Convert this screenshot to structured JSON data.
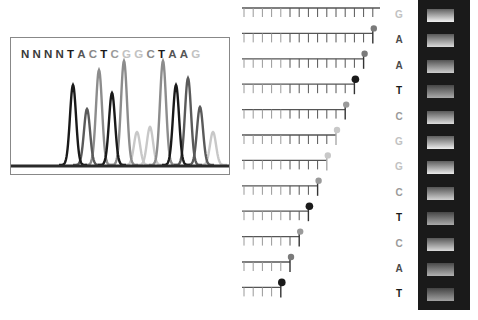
{
  "chromatogram": {
    "sequence": [
      {
        "base": "N",
        "color": "#3a3a3a"
      },
      {
        "base": "N",
        "color": "#3a3a3a"
      },
      {
        "base": "N",
        "color": "#3a3a3a"
      },
      {
        "base": "N",
        "color": "#3a3a3a"
      },
      {
        "base": "T",
        "color": "#1a1a1a"
      },
      {
        "base": "A",
        "color": "#555555"
      },
      {
        "base": "C",
        "color": "#888888"
      },
      {
        "base": "T",
        "color": "#1a1a1a"
      },
      {
        "base": "C",
        "color": "#9a9a9a"
      },
      {
        "base": "G",
        "color": "#c2c2c2"
      },
      {
        "base": "G",
        "color": "#c2c2c2"
      },
      {
        "base": "C",
        "color": "#8a8a8a"
      },
      {
        "base": "T",
        "color": "#1a1a1a"
      },
      {
        "base": "A",
        "color": "#555555"
      },
      {
        "base": "A",
        "color": "#555555"
      },
      {
        "base": "G",
        "color": "#c2c2c2"
      }
    ],
    "peaks": [
      {
        "x": 62,
        "h": 80,
        "color": "#1a1a1a"
      },
      {
        "x": 76,
        "h": 56,
        "color": "#5a5a5a"
      },
      {
        "x": 88,
        "h": 95,
        "color": "#8c8c8c"
      },
      {
        "x": 101,
        "h": 72,
        "color": "#1a1a1a"
      },
      {
        "x": 113,
        "h": 104,
        "color": "#8c8c8c"
      },
      {
        "x": 126,
        "h": 33,
        "color": "#c8c8c8"
      },
      {
        "x": 139,
        "h": 38,
        "color": "#c8c8c8"
      },
      {
        "x": 152,
        "h": 104,
        "color": "#8c8c8c"
      },
      {
        "x": 165,
        "h": 80,
        "color": "#1a1a1a"
      },
      {
        "x": 177,
        "h": 87,
        "color": "#5a5a5a"
      },
      {
        "x": 189,
        "h": 58,
        "color": "#5a5a5a"
      },
      {
        "x": 202,
        "h": 33,
        "color": "#c8c8c8"
      }
    ]
  },
  "fragments": [
    {
      "base": "G",
      "ticks": 15,
      "dot": "#c8c8c8",
      "label_color": "#c2c2c2"
    },
    {
      "base": "A",
      "ticks": 14,
      "dot": "#7a7a7a",
      "label_color": "#4a4a4a"
    },
    {
      "base": "A",
      "ticks": 13,
      "dot": "#7a7a7a",
      "label_color": "#4a4a4a"
    },
    {
      "base": "T",
      "ticks": 12,
      "dot": "#1a1a1a",
      "label_color": "#1a1a1a"
    },
    {
      "base": "C",
      "ticks": 11,
      "dot": "#9a9a9a",
      "label_color": "#9a9a9a"
    },
    {
      "base": "G",
      "ticks": 10,
      "dot": "#c8c8c8",
      "label_color": "#c2c2c2"
    },
    {
      "base": "G",
      "ticks": 9,
      "dot": "#c8c8c8",
      "label_color": "#c2c2c2"
    },
    {
      "base": "C",
      "ticks": 8,
      "dot": "#9a9a9a",
      "label_color": "#9a9a9a"
    },
    {
      "base": "T",
      "ticks": 7,
      "dot": "#1a1a1a",
      "label_color": "#1a1a1a"
    },
    {
      "base": "C",
      "ticks": 6,
      "dot": "#9a9a9a",
      "label_color": "#9a9a9a"
    },
    {
      "base": "A",
      "ticks": 5,
      "dot": "#7a7a7a",
      "label_color": "#4a4a4a"
    },
    {
      "base": "T",
      "ticks": 4,
      "dot": "#1a1a1a",
      "label_color": "#1a1a1a"
    }
  ],
  "gel": {
    "bands": [
      {
        "brightness": 0.95
      },
      {
        "brightness": 0.8
      },
      {
        "brightness": 0.72
      },
      {
        "brightness": 0.5
      },
      {
        "brightness": 0.82
      },
      {
        "brightness": 0.92
      },
      {
        "brightness": 0.9
      },
      {
        "brightness": 0.75
      },
      {
        "brightness": 0.5
      },
      {
        "brightness": 0.8
      },
      {
        "brightness": 0.55
      },
      {
        "brightness": 0.45
      }
    ]
  }
}
